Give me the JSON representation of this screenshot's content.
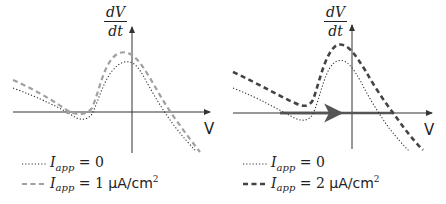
{
  "panels": [
    {
      "id": "left",
      "y_axis_label": {
        "numerator": "dV",
        "denominator": "dt"
      },
      "x_axis_label": "V",
      "legend": [
        {
          "style": "dotted",
          "color": "#333333",
          "variable": "I",
          "subscript": "app",
          "equals": "= 0",
          "units": ""
        },
        {
          "style": "dashed",
          "color": "#a0a0a0",
          "variable": "I",
          "subscript": "app",
          "equals": "= 1",
          "units": "μA/cm",
          "units_sup": "2"
        }
      ]
    },
    {
      "id": "right",
      "y_axis_label": {
        "numerator": "dV",
        "denominator": "dt"
      },
      "x_axis_label": "V",
      "legend": [
        {
          "style": "dotted",
          "color": "#333333",
          "variable": "I",
          "subscript": "app",
          "equals": "= 0",
          "units": ""
        },
        {
          "style": "dashed-thick",
          "color": "#444444",
          "variable": "I",
          "subscript": "app",
          "equals": "= 2",
          "units": "μA/cm",
          "units_sup": "2"
        }
      ],
      "annotation": "thick arrow along V-axis pointing right (no fixed point, trajectory flows toward spike)"
    }
  ],
  "colors": {
    "axis": "#333333",
    "dotted_curve": "#333333",
    "dashed_light": "#a0a0a0",
    "dashed_dark": "#444444",
    "flow_arrow": "#555555"
  }
}
